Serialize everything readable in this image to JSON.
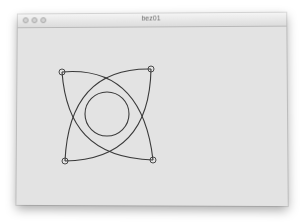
{
  "window": {
    "title": "bez01",
    "buttons": [
      "close",
      "minimize",
      "zoom"
    ],
    "title_color": "#6a6a6a",
    "content_background": "#e3e3e3"
  },
  "drawing": {
    "stroke_color": "#3a3a3a",
    "control_points": [
      {
        "name": "top-left",
        "x": 62,
        "y": 72
      },
      {
        "name": "top-right",
        "x": 151,
        "y": 69
      },
      {
        "name": "bottom-left",
        "x": 65,
        "y": 161
      },
      {
        "name": "bottom-right",
        "x": 153,
        "y": 160
      }
    ],
    "circle": {
      "cx": 107,
      "cy": 114,
      "r": 22
    }
  }
}
